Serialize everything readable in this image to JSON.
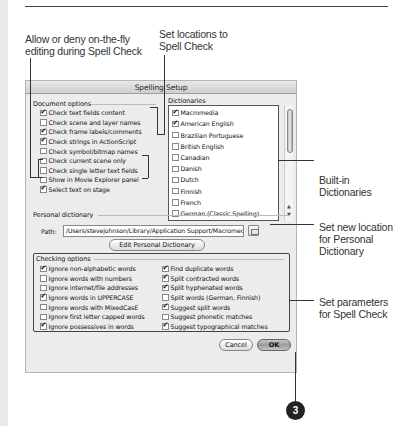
{
  "callouts": {
    "allow_deny": [
      "Allow or deny on-the-fly",
      "editing during Spell Check"
    ],
    "set_locations": [
      "Set locations to",
      "Spell Check"
    ],
    "built_in": [
      "Built-in",
      "Dictionaries"
    ],
    "new_location": [
      "Set new location",
      "for Personal",
      "Dictionary"
    ],
    "parameters": [
      "Set parameters",
      "for Spell Check"
    ],
    "step_number": "3"
  },
  "dialog": {
    "title": "Spelling Setup",
    "document_options": {
      "label": "Document options",
      "items": [
        {
          "label": "Check text fields content",
          "checked": true
        },
        {
          "label": "Check scene and layer names",
          "checked": false
        },
        {
          "label": "Check frame labels/comments",
          "checked": true
        },
        {
          "label": "Check strings in ActionScript",
          "checked": true
        },
        {
          "label": "Check symbol/bitmap names",
          "checked": false
        },
        {
          "label": "Check current scene only",
          "checked": false
        },
        {
          "label": "Check single letter text fields",
          "checked": false
        },
        {
          "label": "Show in Movie Explorer panel",
          "checked": false
        },
        {
          "label": "Select text on stage",
          "checked": true
        }
      ]
    },
    "dictionaries": {
      "label": "Dictionaries",
      "items": [
        {
          "label": "Macromedia",
          "checked": true
        },
        {
          "label": "American English",
          "checked": true
        },
        {
          "label": "Brazilian Portuguese",
          "checked": false
        },
        {
          "label": "British English",
          "checked": false
        },
        {
          "label": "Canadian",
          "checked": false
        },
        {
          "label": "Danish",
          "checked": false
        },
        {
          "label": "Dutch",
          "checked": false
        },
        {
          "label": "Finnish",
          "checked": false
        },
        {
          "label": "French",
          "checked": false
        },
        {
          "label": "German (Classic Spelling)",
          "checked": false
        }
      ]
    },
    "personal_dictionary": {
      "label": "Personal dictionary",
      "path_label": "Path:",
      "path_value": "/Users/stevejohnson/Library/Application Support/Macromedia",
      "edit_button": "Edit Personal Dictionary"
    },
    "checking_options": {
      "label": "Checking options",
      "left": [
        {
          "label": "Ignore non-alphabetic words",
          "checked": true
        },
        {
          "label": "Ignore words with numbers",
          "checked": false
        },
        {
          "label": "Ignore internet/file addresses",
          "checked": false
        },
        {
          "label": "Ignore words in UPPERCASE",
          "checked": true
        },
        {
          "label": "Ignore words with MixedCasE",
          "checked": false
        },
        {
          "label": "Ignore first letter capped words",
          "checked": false
        },
        {
          "label": "Ignore possessives in words",
          "checked": true
        }
      ],
      "right": [
        {
          "label": "Find duplicate words",
          "checked": true
        },
        {
          "label": "Split contracted words",
          "checked": true
        },
        {
          "label": "Split hyphenated words",
          "checked": true
        },
        {
          "label": "Split words (German, Finnish)",
          "checked": false
        },
        {
          "label": "Suggest split words",
          "checked": true
        },
        {
          "label": "Suggest phonetic matches",
          "checked": false
        },
        {
          "label": "Suggest typographical matches",
          "checked": true
        }
      ]
    },
    "buttons": {
      "cancel": "Cancel",
      "ok": "OK"
    }
  }
}
